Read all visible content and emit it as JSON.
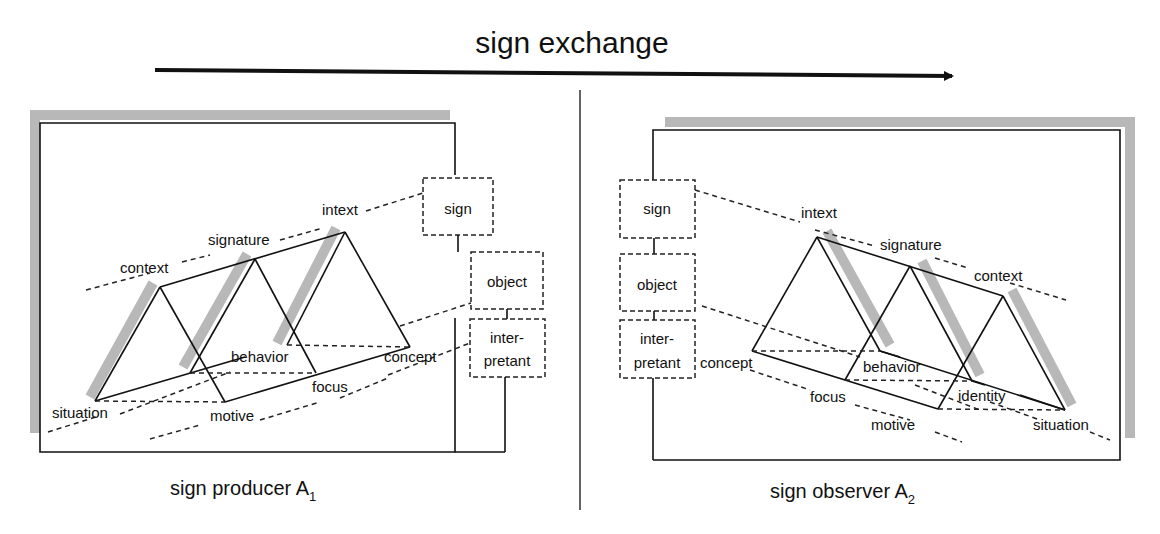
{
  "title": "sign exchange",
  "colors": {
    "ink": "#111111",
    "shadow": "#b8b8b8",
    "background": "#ffffff"
  },
  "arrow": {
    "x1": 155,
    "y1": 70,
    "x2": 955,
    "y2": 76
  },
  "divider": {
    "x": 580,
    "y1": 90,
    "y2": 510
  },
  "producer": {
    "caption": "sign producer A",
    "caption_sub": "1",
    "semiotic_boxes": {
      "sign": "sign",
      "object": "object",
      "interpretant_line1": "inter-",
      "interpretant_line2": "pretant"
    },
    "labels": {
      "intext": "intext",
      "signature": "signature",
      "context": "context",
      "behavior": "behavior",
      "concept": "concept",
      "focus": "focus",
      "situation": "situation",
      "motive": "motive"
    }
  },
  "observer": {
    "caption": "sign observer A",
    "caption_sub": "2",
    "semiotic_boxes": {
      "sign": "sign",
      "object": "object",
      "interpretant_line1": "inter-",
      "interpretant_line2": "pretant"
    },
    "labels": {
      "intext": "intext",
      "signature": "signature",
      "context": "context",
      "behavior": "behavior",
      "identity": "identity",
      "concept": "concept",
      "focus": "focus",
      "motive": "motive",
      "situation": "situation"
    }
  }
}
